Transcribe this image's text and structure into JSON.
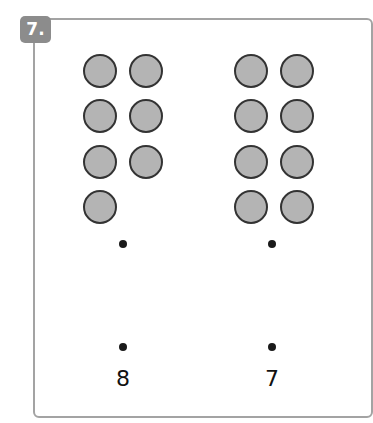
{
  "exercise": {
    "badge_label": "7.",
    "badge_color": "#8c8c8c",
    "frame_color": "#a3a3a3"
  },
  "groups": [
    {
      "name": "left",
      "counter_count": 7,
      "label": "8",
      "counter_positions": [
        [
          100,
          71
        ],
        [
          146,
          71
        ],
        [
          100,
          116
        ],
        [
          146,
          116
        ],
        [
          100,
          162
        ],
        [
          146,
          162
        ],
        [
          100,
          207
        ]
      ],
      "top_dot": [
        123,
        244
      ],
      "bottom_dot": [
        123,
        347
      ],
      "label_pos": [
        123,
        380
      ]
    },
    {
      "name": "right",
      "counter_count": 8,
      "label": "7",
      "counter_positions": [
        [
          251,
          71
        ],
        [
          297,
          71
        ],
        [
          251,
          116
        ],
        [
          297,
          116
        ],
        [
          251,
          162
        ],
        [
          297,
          162
        ],
        [
          251,
          207
        ],
        [
          297,
          207
        ]
      ],
      "top_dot": [
        272,
        244
      ],
      "bottom_dot": [
        272,
        347
      ],
      "label_pos": [
        272,
        380
      ]
    }
  ],
  "colors": {
    "counter_fill": "#b4b4b4",
    "counter_border": "#333333",
    "dot": "#1a1a1a"
  }
}
